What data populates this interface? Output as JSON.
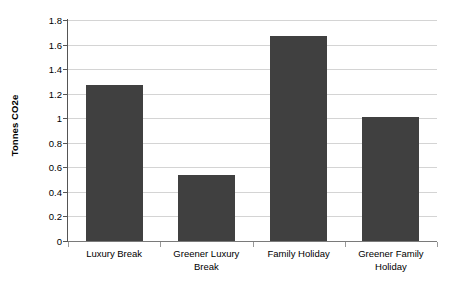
{
  "chart_data": {
    "type": "bar",
    "title": "",
    "subtitle": "",
    "xlabel": "",
    "ylabel": "Tonnes CO2e",
    "categories": [
      "Luxury Break",
      "Greener Luxury Break",
      "Family Holiday",
      "Greener Family Holiday"
    ],
    "values": [
      1.27,
      0.54,
      1.67,
      1.01
    ],
    "ylim": [
      0,
      1.8
    ],
    "ytick_step": 0.2,
    "ytick_labels": [
      "0",
      "0.2",
      "0.4",
      "0.6",
      "0.8",
      "1",
      "1.2",
      "1.4",
      "1.6",
      "1.8"
    ],
    "ytick_values": [
      0,
      0.2,
      0.4,
      0.6,
      0.8,
      1,
      1.2,
      1.4,
      1.6,
      1.8
    ],
    "grid": true,
    "legend": false,
    "legend_position": "none",
    "series": [
      {
        "name": "Tonnes CO2e",
        "color": "#404040",
        "values": [
          1.27,
          0.54,
          1.67,
          1.01
        ]
      }
    ],
    "colors": {
      "bar": "#404040",
      "gridline": "#d4d4d4",
      "axis": "#555555",
      "baseline": "#7a7a7a",
      "text": "#000000",
      "background": "#ffffff"
    }
  }
}
